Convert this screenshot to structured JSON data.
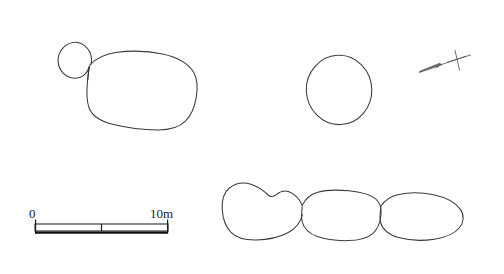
{
  "figure": {
    "kind": "archaeological-site-plan",
    "background_color": "#ffffff",
    "line_color": "#3a3a3a",
    "width": 504,
    "height": 274
  },
  "scale_bar": {
    "start_label": "0",
    "end_label": "10m",
    "units": "m",
    "total_length_value": 10,
    "divisions": 2,
    "division_value": 5,
    "pixel_start_x": 35,
    "pixel_end_x": 168,
    "pixel_y": 228
  },
  "north_arrow": {
    "label": "",
    "description": "thin tapered arrow pointing lower-left with cross tick at upper-right end",
    "tip_x": 419,
    "tip_y": 72,
    "tail_x": 466,
    "tail_y": 56
  },
  "structures": [
    {
      "id": "structure-1",
      "name": "circular annex with large oval enclosure",
      "parts": [
        {
          "part": "small-circle",
          "cx": 75,
          "cy": 60,
          "rx": 17,
          "ry": 18
        },
        {
          "part": "large-oval-enclosure",
          "cx": 142,
          "cy": 91,
          "rx": 55,
          "ry": 39
        }
      ]
    },
    {
      "id": "structure-2",
      "name": "isolated circular enclosure",
      "parts": [
        {
          "part": "circle",
          "cx": 339,
          "cy": 90,
          "rx": 33,
          "ry": 35
        }
      ]
    },
    {
      "id": "structure-3",
      "name": "conjoined three-cell compound",
      "parts": [
        {
          "part": "west-cell",
          "cx": 262,
          "cy": 212
        },
        {
          "part": "central-cell",
          "cx": 341,
          "cy": 213
        },
        {
          "part": "east-cell",
          "cx": 419,
          "cy": 213
        }
      ]
    }
  ]
}
